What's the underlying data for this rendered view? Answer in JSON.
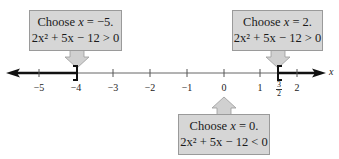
{
  "diagram": {
    "type": "number-line-test-intervals",
    "axis": {
      "variable": "x",
      "ticks": [
        {
          "value": -5,
          "label": "−5"
        },
        {
          "value": -4,
          "label": "−4"
        },
        {
          "value": -3,
          "label": "−3"
        },
        {
          "value": -2,
          "label": "−2"
        },
        {
          "value": -1,
          "label": "−1"
        },
        {
          "value": 0,
          "label": "0"
        },
        {
          "value": 1,
          "label": "1"
        },
        {
          "value": 1.5,
          "label_num": "3",
          "label_den": "2"
        },
        {
          "value": 2,
          "label": "2"
        }
      ],
      "critical_points": [
        {
          "value": -4,
          "bracket": "]",
          "included": true
        },
        {
          "value": 1.5,
          "bracket": "[",
          "included": true
        }
      ],
      "shaded_intervals": [
        "(-∞, -4]",
        "[3/2, ∞)"
      ]
    },
    "callouts": [
      {
        "id": "left",
        "choose": "Choose x = −5.",
        "choose_prefix": "Choose ",
        "choose_var": "x",
        "choose_suffix": " = −5.",
        "inequality": "2x² + 5x − 12 > 0",
        "points_to": -5,
        "arrow": "down"
      },
      {
        "id": "right",
        "choose": "Choose x = 2.",
        "choose_prefix": "Choose ",
        "choose_var": "x",
        "choose_suffix": " = 2.",
        "inequality": "2x² + 5x − 12 > 0",
        "points_to": 2,
        "arrow": "down"
      },
      {
        "id": "middle",
        "choose": "Choose x = 0.",
        "choose_prefix": "Choose ",
        "choose_var": "x",
        "choose_suffix": " = 0.",
        "inequality": "2x² + 5x − 12 < 0",
        "points_to": 0,
        "arrow": "up"
      }
    ],
    "colors": {
      "box_fill": "#d6d6d6",
      "box_border": "#9a9a9a",
      "arrow_fill": "#d0d0d0",
      "line": "#555555",
      "shaded": "#111111"
    }
  }
}
